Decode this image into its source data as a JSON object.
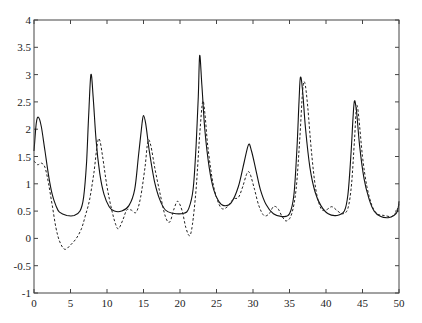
{
  "chart_data": {
    "type": "line",
    "title": "",
    "xlabel": "",
    "ylabel": "",
    "xlim": [
      0,
      50
    ],
    "ylim": [
      -1,
      4
    ],
    "grid": false,
    "legend": null,
    "x_ticks": [
      0,
      5,
      10,
      15,
      20,
      25,
      30,
      35,
      40,
      45,
      50
    ],
    "x_tick_labels": [
      "0",
      "5",
      "10",
      "15",
      "20",
      "25",
      "30",
      "35",
      "40",
      "45",
      "50"
    ],
    "y_ticks": [
      -1,
      -0.5,
      0,
      0.5,
      1,
      1.5,
      2,
      2.5,
      3,
      3.5,
      4
    ],
    "y_tick_labels": [
      "-1",
      "-0.5",
      "0",
      "0.5",
      "1",
      "1.5",
      "2",
      "2.5",
      "3",
      "3.5",
      "4"
    ],
    "series": [
      {
        "name": "solid",
        "style": "solid",
        "color": "#111111",
        "points": [
          [
            0,
            1.6
          ],
          [
            0.3,
            2.1
          ],
          [
            0.6,
            2.22
          ],
          [
            1.0,
            2.05
          ],
          [
            1.5,
            1.6
          ],
          [
            2.0,
            1.15
          ],
          [
            2.5,
            0.8
          ],
          [
            3.0,
            0.6
          ],
          [
            3.5,
            0.48
          ],
          [
            4.5,
            0.42
          ],
          [
            5.5,
            0.42
          ],
          [
            6.3,
            0.5
          ],
          [
            6.8,
            0.75
          ],
          [
            7.2,
            1.4
          ],
          [
            7.5,
            2.3
          ],
          [
            7.8,
            3.0
          ],
          [
            8.1,
            2.6
          ],
          [
            8.5,
            1.8
          ],
          [
            9.0,
            1.2
          ],
          [
            9.6,
            0.8
          ],
          [
            10.3,
            0.58
          ],
          [
            11.0,
            0.5
          ],
          [
            12.0,
            0.5
          ],
          [
            13.0,
            0.6
          ],
          [
            13.8,
            0.9
          ],
          [
            14.3,
            1.5
          ],
          [
            14.8,
            2.1
          ],
          [
            15.0,
            2.25
          ],
          [
            15.3,
            2.1
          ],
          [
            15.8,
            1.6
          ],
          [
            16.5,
            1.05
          ],
          [
            17.2,
            0.72
          ],
          [
            18.0,
            0.52
          ],
          [
            19.0,
            0.46
          ],
          [
            20.5,
            0.46
          ],
          [
            21.2,
            0.55
          ],
          [
            21.8,
            0.9
          ],
          [
            22.2,
            1.7
          ],
          [
            22.5,
            2.6
          ],
          [
            22.7,
            3.35
          ],
          [
            23.0,
            2.8
          ],
          [
            23.4,
            2.0
          ],
          [
            24.0,
            1.3
          ],
          [
            24.6,
            0.9
          ],
          [
            25.3,
            0.68
          ],
          [
            26.0,
            0.6
          ],
          [
            27.0,
            0.65
          ],
          [
            28.0,
            0.95
          ],
          [
            28.8,
            1.4
          ],
          [
            29.4,
            1.72
          ],
          [
            29.8,
            1.6
          ],
          [
            30.4,
            1.25
          ],
          [
            31.0,
            0.9
          ],
          [
            31.8,
            0.62
          ],
          [
            32.8,
            0.45
          ],
          [
            34.0,
            0.4
          ],
          [
            35.0,
            0.45
          ],
          [
            35.6,
            0.8
          ],
          [
            36.0,
            1.6
          ],
          [
            36.3,
            2.5
          ],
          [
            36.5,
            2.95
          ],
          [
            36.8,
            2.7
          ],
          [
            37.2,
            2.0
          ],
          [
            37.8,
            1.3
          ],
          [
            38.5,
            0.85
          ],
          [
            39.3,
            0.6
          ],
          [
            40.3,
            0.45
          ],
          [
            41.5,
            0.42
          ],
          [
            42.5,
            0.5
          ],
          [
            43.0,
            0.8
          ],
          [
            43.4,
            1.5
          ],
          [
            43.7,
            2.2
          ],
          [
            43.9,
            2.52
          ],
          [
            44.2,
            2.3
          ],
          [
            44.6,
            1.7
          ],
          [
            45.2,
            1.1
          ],
          [
            45.9,
            0.72
          ],
          [
            46.6,
            0.5
          ],
          [
            47.5,
            0.4
          ],
          [
            48.5,
            0.38
          ],
          [
            49.3,
            0.42
          ],
          [
            49.8,
            0.5
          ],
          [
            50.0,
            0.68
          ]
        ]
      },
      {
        "name": "dashed",
        "style": "dashed",
        "color": "#222222",
        "points": [
          [
            0,
            1.42
          ],
          [
            0.5,
            1.35
          ],
          [
            1.0,
            1.38
          ],
          [
            1.5,
            1.3
          ],
          [
            2.0,
            1.0
          ],
          [
            2.5,
            0.6
          ],
          [
            3.0,
            0.2
          ],
          [
            3.5,
            -0.05
          ],
          [
            4.2,
            -0.2
          ],
          [
            5.0,
            -0.12
          ],
          [
            5.8,
            0.0
          ],
          [
            6.5,
            0.18
          ],
          [
            7.0,
            0.4
          ],
          [
            7.6,
            0.7
          ],
          [
            8.2,
            1.2
          ],
          [
            8.7,
            1.75
          ],
          [
            9.0,
            1.8
          ],
          [
            9.4,
            1.5
          ],
          [
            10.0,
            0.95
          ],
          [
            10.6,
            0.55
          ],
          [
            11.2,
            0.25
          ],
          [
            11.6,
            0.18
          ],
          [
            12.2,
            0.35
          ],
          [
            12.7,
            0.52
          ],
          [
            13.3,
            0.52
          ],
          [
            14.0,
            0.48
          ],
          [
            14.6,
            0.75
          ],
          [
            15.2,
            1.3
          ],
          [
            15.6,
            1.78
          ],
          [
            16.0,
            1.7
          ],
          [
            16.6,
            1.25
          ],
          [
            17.3,
            0.8
          ],
          [
            18.0,
            0.4
          ],
          [
            18.6,
            0.3
          ],
          [
            19.2,
            0.55
          ],
          [
            19.7,
            0.68
          ],
          [
            20.3,
            0.5
          ],
          [
            20.8,
            0.2
          ],
          [
            21.3,
            0.05
          ],
          [
            21.7,
            0.25
          ],
          [
            22.2,
            0.9
          ],
          [
            22.7,
            1.9
          ],
          [
            23.1,
            2.5
          ],
          [
            23.4,
            2.3
          ],
          [
            23.8,
            1.7
          ],
          [
            24.4,
            1.1
          ],
          [
            25.0,
            0.75
          ],
          [
            25.7,
            0.55
          ],
          [
            26.5,
            0.58
          ],
          [
            27.3,
            0.72
          ],
          [
            28.0,
            0.75
          ],
          [
            28.6,
            0.95
          ],
          [
            29.2,
            1.2
          ],
          [
            29.6,
            1.18
          ],
          [
            30.2,
            0.9
          ],
          [
            30.8,
            0.6
          ],
          [
            31.5,
            0.42
          ],
          [
            32.2,
            0.45
          ],
          [
            32.8,
            0.58
          ],
          [
            33.4,
            0.55
          ],
          [
            34.0,
            0.4
          ],
          [
            34.6,
            0.32
          ],
          [
            35.3,
            0.45
          ],
          [
            35.9,
            0.9
          ],
          [
            36.4,
            1.8
          ],
          [
            36.8,
            2.7
          ],
          [
            37.1,
            2.85
          ],
          [
            37.5,
            2.4
          ],
          [
            38.0,
            1.6
          ],
          [
            38.6,
            0.9
          ],
          [
            39.3,
            0.55
          ],
          [
            40.0,
            0.52
          ],
          [
            40.8,
            0.58
          ],
          [
            41.6,
            0.5
          ],
          [
            42.3,
            0.45
          ],
          [
            43.0,
            0.55
          ],
          [
            43.5,
            1.0
          ],
          [
            43.9,
            1.8
          ],
          [
            44.2,
            2.42
          ],
          [
            44.5,
            2.2
          ],
          [
            45.0,
            1.5
          ],
          [
            45.6,
            0.95
          ],
          [
            46.3,
            0.6
          ],
          [
            47.0,
            0.45
          ],
          [
            48.0,
            0.42
          ],
          [
            49.0,
            0.4
          ],
          [
            49.6,
            0.48
          ],
          [
            50.0,
            0.62
          ]
        ]
      }
    ]
  }
}
